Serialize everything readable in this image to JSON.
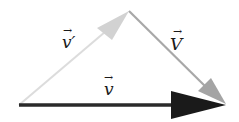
{
  "diagram": {
    "type": "vector-triangle",
    "background": "#ffffff",
    "points": {
      "origin": [
        19,
        105
      ],
      "apex": [
        129,
        11
      ],
      "tip": [
        226,
        105
      ]
    },
    "vectors": [
      {
        "id": "v_prime",
        "label": "v′",
        "from": "origin",
        "to": "apex",
        "color": "#d6d6d6",
        "label_pos": [
          63,
          48
        ]
      },
      {
        "id": "V",
        "label": "V",
        "from": "apex",
        "to": "tip",
        "color": "#a8a8a8",
        "label_pos": [
          172,
          50
        ]
      },
      {
        "id": "v",
        "label": "v",
        "from": "origin",
        "to": "tip",
        "color": "#1e1e1e",
        "label_pos": [
          104,
          96
        ]
      }
    ],
    "arrow_marker": "→"
  }
}
